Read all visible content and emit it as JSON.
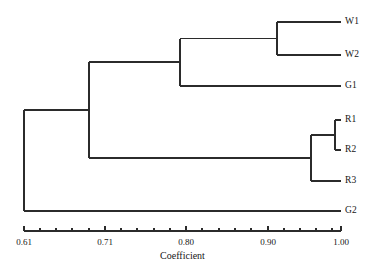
{
  "figure": {
    "type": "dendrogram",
    "background_color": "#ffffff",
    "line_color": "#2b2b2b",
    "text_color": "#161616"
  },
  "axis": {
    "title": "Coefficient",
    "min": 0.61,
    "max": 1.0,
    "pixel_left": 24,
    "pixel_right": 341,
    "baseline_y": 231,
    "major_ticks": [
      {
        "value": 0.61,
        "label": "0.61",
        "x": 24
      },
      {
        "value": 0.71,
        "label": "0.71",
        "x": 105
      },
      {
        "value": 0.8,
        "label": "0.80",
        "x": 186
      },
      {
        "value": 0.9,
        "label": "0.90",
        "x": 268
      },
      {
        "value": 1.0,
        "label": "1.00",
        "x": 341
      }
    ],
    "minor_ticks_x": [
      40,
      56,
      72,
      89,
      121,
      137,
      154,
      170,
      202,
      219,
      235,
      251,
      284,
      300,
      316,
      332
    ]
  },
  "chart_data": {
    "type": "dendrogram",
    "title": "",
    "xlabel": "Coefficient",
    "ylabel": "",
    "xlim": [
      0.61,
      1.0
    ],
    "grid": false,
    "legend": "none",
    "orientation": "horizontal-right-leaves",
    "leaves": [
      {
        "name": "W1",
        "y": 22,
        "merge_x": 0.9
      },
      {
        "name": "W2",
        "y": 55,
        "merge_x": 0.9
      },
      {
        "name": "G1",
        "y": 86,
        "merge_x": 0.795
      },
      {
        "name": "R1",
        "y": 120,
        "merge_x": 0.985
      },
      {
        "name": "R2",
        "y": 150,
        "merge_x": 0.985
      },
      {
        "name": "R3",
        "y": 181,
        "merge_x": 0.955
      },
      {
        "name": "G2",
        "y": 211,
        "merge_x": 0.61
      }
    ],
    "nodes": [
      {
        "id": "n1",
        "label": "W1-W2",
        "coefficient": 0.9,
        "x": 277,
        "y_top": 22,
        "y_bottom": 55,
        "y_mid": 38.5,
        "members": [
          "W1",
          "W2"
        ]
      },
      {
        "id": "n2",
        "label": "(W1,W2)-G1",
        "coefficient": 0.795,
        "x": 180,
        "y_top": 38.5,
        "y_bottom": 86,
        "y_mid": 62,
        "members": [
          "W1",
          "W2",
          "G1"
        ]
      },
      {
        "id": "n3",
        "label": "R1-R2",
        "coefficient": 0.985,
        "x": 335,
        "y_top": 120,
        "y_bottom": 150,
        "y_mid": 135,
        "members": [
          "R1",
          "R2"
        ]
      },
      {
        "id": "n4",
        "label": "(R1,R2)-R3",
        "coefficient": 0.955,
        "x": 311,
        "y_top": 135,
        "y_bottom": 181,
        "y_mid": 158,
        "members": [
          "R1",
          "R2",
          "R3"
        ]
      },
      {
        "id": "n5",
        "label": "W-cluster-R-cluster",
        "coefficient": 0.69,
        "x": 89,
        "y_top": 62,
        "y_bottom": 158,
        "y_mid": 110,
        "members": [
          "W1",
          "W2",
          "G1",
          "R1",
          "R2",
          "R3"
        ]
      },
      {
        "id": "n6",
        "label": "root-G2",
        "coefficient": 0.61,
        "x": 24,
        "y_top": 110,
        "y_bottom": 211,
        "y_mid": 160,
        "members": [
          "W1",
          "W2",
          "G1",
          "R1",
          "R2",
          "R3",
          "G2"
        ]
      }
    ],
    "leaf_label_x": 345
  }
}
